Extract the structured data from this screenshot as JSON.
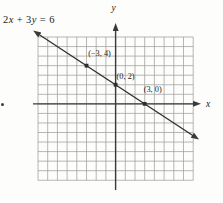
{
  "figure": {
    "equation_label": "2x + 3y = 6",
    "x_axis_label": "x",
    "y_axis_label": "y"
  },
  "chart_data": {
    "type": "line",
    "equation": "2x + 3y = 6",
    "slope": -0.6666666667,
    "y_intercept": 2,
    "points": [
      {
        "x": -3,
        "y": 4,
        "label": "(−3, 4)",
        "label_dx": 13,
        "label_dy": -10
      },
      {
        "x": 0,
        "y": 2,
        "label": "(0, 2)",
        "label_dx": 10,
        "label_dy": -6
      },
      {
        "x": 3,
        "y": 0,
        "label": "(3, 0)",
        "label_dx": 8,
        "label_dy": -12
      }
    ],
    "xlabel": "x",
    "ylabel": "y",
    "grid": true,
    "x_range": [
      -8,
      8
    ],
    "y_range": [
      -8,
      7
    ],
    "line_draw_x_extent": [
      -7.9,
      8.0
    ],
    "colors": {
      "background": "#fdfdfb",
      "grid": "#9f9f9f",
      "axis": "#3a3a3a",
      "line": "#2e2e2e",
      "text": "#1c1c1c"
    }
  }
}
